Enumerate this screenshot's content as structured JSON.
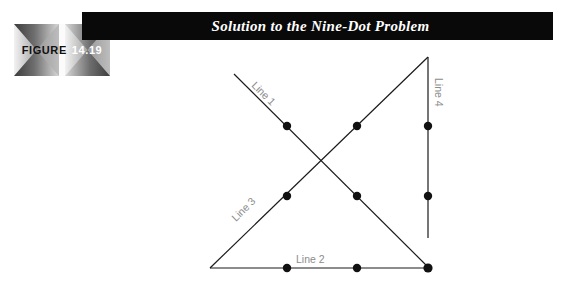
{
  "figure": {
    "badge_word": "FIGURE",
    "badge_number": "14.19"
  },
  "header": {
    "title": "Solution to the Nine-Dot Problem",
    "bar_color": "#090909",
    "title_color": "#ffffff"
  },
  "diagram": {
    "name": "nine-dot-problem-solution",
    "label_color": "#8c8c8c",
    "stroke_color": "#1a1a1a",
    "dot_color": "#111111",
    "dot_radius": 4.2,
    "labels": {
      "line1": "Line 1",
      "line2": "Line 2",
      "line3": "Line 3",
      "line4": "Line 4"
    },
    "lines": [
      {
        "id": "line1",
        "label": "Line 1",
        "x1": 234,
        "y1": 74,
        "x2": 429,
        "y2": 268
      },
      {
        "id": "line2",
        "label": "Line 2",
        "x1": 210,
        "y1": 268,
        "x2": 429,
        "y2": 268
      },
      {
        "id": "line3",
        "label": "Line 3",
        "x1": 210,
        "y1": 268,
        "x2": 428,
        "y2": 57
      },
      {
        "id": "line4",
        "label": "Line 4",
        "x1": 428,
        "y1": 57,
        "x2": 428,
        "y2": 238
      }
    ],
    "dots": [
      {
        "row": "top",
        "col": 1,
        "x": 287,
        "y": 126
      },
      {
        "row": "top",
        "col": 2,
        "x": 357,
        "y": 126
      },
      {
        "row": "top",
        "col": 3,
        "x": 428,
        "y": 126
      },
      {
        "row": "middle",
        "col": 1,
        "x": 287,
        "y": 196
      },
      {
        "row": "middle",
        "col": 2,
        "x": 357,
        "y": 196
      },
      {
        "row": "middle",
        "col": 3,
        "x": 428,
        "y": 196
      },
      {
        "row": "bottom",
        "col": 1,
        "x": 287,
        "y": 268
      },
      {
        "row": "bottom",
        "col": 2,
        "x": 357,
        "y": 268
      },
      {
        "row": "bottom",
        "col": 3,
        "x": 428,
        "y": 268
      }
    ]
  }
}
